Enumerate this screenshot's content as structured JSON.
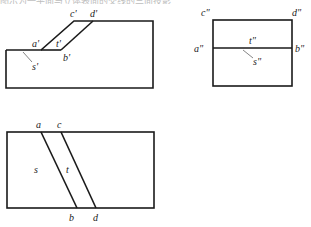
{
  "header": {
    "text": "图示为一平面与立体表面的交线的三面投影"
  },
  "views": {
    "front": {
      "labels": {
        "a": "a'",
        "b": "b'",
        "c": "c'",
        "d": "d'",
        "s": "s'",
        "t": "t'"
      }
    },
    "side": {
      "labels": {
        "a": "a\"",
        "b": "b\"",
        "c": "c\"",
        "d": "d\"",
        "s": "s\"",
        "t": "t\""
      }
    },
    "top": {
      "labels": {
        "a": "a",
        "b": "b",
        "c": "c",
        "d": "d",
        "s": "s",
        "t": "t"
      }
    }
  },
  "colors": {
    "line": "#1a1a1a",
    "leader": "#666666",
    "text": "#222222"
  }
}
